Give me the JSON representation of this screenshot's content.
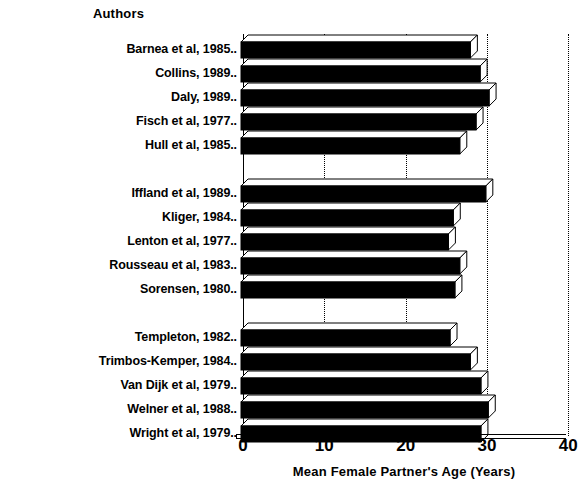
{
  "chart_data": {
    "type": "bar",
    "orientation": "horizontal",
    "title": "",
    "xlabel": "Mean Female Partner's Age (Years)",
    "ylabel": "Authors",
    "xlim": [
      0,
      40
    ],
    "xticks": [
      0,
      10,
      20,
      30,
      40
    ],
    "xtick_labels": [
      "0",
      "10",
      "20",
      "30",
      "40"
    ],
    "grid": "vertical dotted gridlines at 10, 20, 30, 40",
    "legend": "none",
    "style": "3d-shaded black bars",
    "groups": [
      {
        "members": [
          "Barnea et al, 1985..",
          "Collins, 1989..",
          "Daly, 1989..",
          "Fisch et al, 1977..",
          "Hull et al, 1985.."
        ]
      },
      {
        "members": [
          "Iffland et al, 1989..",
          "Kliger, 1984..",
          "Lenton et al, 1977..",
          "Rousseau et al, 1983..",
          "Sorensen, 1980.."
        ]
      },
      {
        "members": [
          "Templeton, 1982..",
          "Trimbos-Kemper, 1984..",
          "Van Dijk et al, 1979..",
          "Welner et al, 1988..",
          "Wright et al, 1979.."
        ]
      }
    ],
    "categories": [
      "Barnea et al, 1985..",
      "Collins, 1989..",
      "Daly, 1989..",
      "Fisch et al, 1977..",
      "Hull et al, 1985..",
      "Iffland et al, 1989..",
      "Kliger, 1984..",
      "Lenton et al, 1977..",
      "Rousseau et al, 1983..",
      "Sorensen, 1980..",
      "Templeton, 1982..",
      "Trimbos-Kemper, 1984..",
      "Van Dijk et al, 1979..",
      "Welner et al, 1988..",
      "Wright et al, 1979.."
    ],
    "values": [
      28.2,
      29.4,
      30.5,
      28.9,
      26.9,
      30.1,
      26.1,
      25.5,
      26.9,
      26.3,
      25.7,
      28.2,
      29.5,
      30.4,
      29.5
    ]
  },
  "axes": {
    "top_title": "Authors",
    "bottom_title": "Mean Female Partner's Age (Years)"
  },
  "colors": {
    "bar_face": "#000000",
    "bar_side": "#ffffff",
    "outline": "#000000",
    "background": "#ffffff",
    "grid": "#000000"
  }
}
